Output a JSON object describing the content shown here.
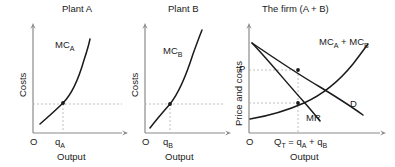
{
  "figure": {
    "kind": "economics-diagram"
  },
  "panels": [
    {
      "id": "plant-a",
      "title": "Plant A",
      "y_axis_label": "Costs",
      "x_axis_label": "Output",
      "origin_label": "O",
      "quantity_label": "q",
      "quantity_sub": "A",
      "curve_label": "MC",
      "curve_sub": "A",
      "curves": [
        {
          "name": "MC_A",
          "type": "marginal-cost",
          "points": [
            [
              0,
              0
            ],
            [
              10,
              9
            ],
            [
              20,
              17
            ],
            [
              30,
              26
            ],
            [
              40,
              36
            ],
            [
              50,
              48
            ],
            [
              60,
              62
            ],
            [
              70,
              80
            ],
            [
              78,
              96
            ]
          ]
        }
      ],
      "guides": {
        "equilibrium_point": [
          34,
          30
        ],
        "horizontal_dashed": true,
        "vertical_dashed": true
      }
    },
    {
      "id": "plant-b",
      "title": "Plant B",
      "y_axis_label": "Costs",
      "x_axis_label": "Output",
      "origin_label": "O",
      "quantity_label": "q",
      "quantity_sub": "B",
      "curve_label": "MC",
      "curve_sub": "B",
      "curves": [
        {
          "name": "MC_B",
          "type": "marginal-cost",
          "points": [
            [
              0,
              0
            ],
            [
              10,
              10
            ],
            [
              20,
              20
            ],
            [
              30,
              31
            ],
            [
              40,
              44
            ],
            [
              50,
              60
            ],
            [
              60,
              79
            ],
            [
              68,
              96
            ]
          ]
        }
      ],
      "guides": {
        "equilibrium_point": [
          29,
          30
        ],
        "horizontal_dashed": true,
        "vertical_dashed": true
      }
    },
    {
      "id": "the-firm",
      "title": "The firm (A + B)",
      "y_axis_label": "Price and costs",
      "x_axis_label": "Output",
      "origin_label": "O",
      "price_label": "P",
      "quantity_label": "Q",
      "quantity_sub": "T",
      "quantity_expr": " = q",
      "quantity_expr_sub_a": "A",
      "quantity_expr_mid": " + q",
      "quantity_expr_sub_b": "B",
      "demand_label": "D",
      "marginal_revenue_label": "MR",
      "sum_curve_label": "MC",
      "sum_curve_sub_a": "A",
      "sum_curve_plus": " + MC",
      "sum_curve_sub_b": "B",
      "curves": [
        {
          "name": "D",
          "type": "demand",
          "points": [
            [
              0,
              100
            ],
            [
              20,
              78
            ],
            [
              40,
              57
            ],
            [
              60,
              37
            ],
            [
              80,
              19
            ],
            [
              96,
              4
            ]
          ]
        },
        {
          "name": "MR",
          "type": "marginal-revenue",
          "points": [
            [
              0,
              100
            ],
            [
              20,
              67
            ],
            [
              40,
              36
            ],
            [
              55,
              13
            ]
          ]
        },
        {
          "name": "MC_A + MC_B",
          "type": "summed-marginal-cost",
          "points": [
            [
              0,
              14
            ],
            [
              15,
              17
            ],
            [
              30,
              22
            ],
            [
              45,
              30
            ],
            [
              60,
              42
            ],
            [
              75,
              60
            ],
            [
              88,
              80
            ],
            [
              95,
              93
            ]
          ]
        }
      ],
      "guides": {
        "price_point": [
          39,
          58
        ],
        "equilibrium_point": [
          39,
          27
        ],
        "horizontal_dashed_price": true,
        "horizontal_dashed_mr": true,
        "vertical_dashed": true
      }
    }
  ],
  "colors": {
    "curve": "#1a1a1a",
    "axis": "#8a8a8a",
    "guide": "#b0b0b0",
    "text": "#1a1a1a",
    "background": "#ffffff"
  }
}
